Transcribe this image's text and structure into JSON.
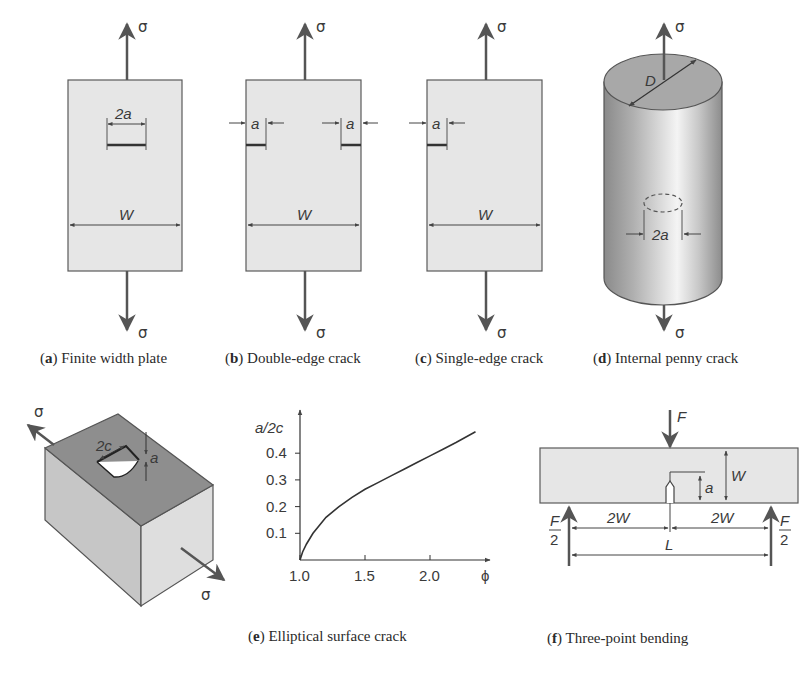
{
  "figure": {
    "colors": {
      "plate_fill": "#e6e6e6",
      "plate_stroke": "#5a5a5a",
      "arrow": "#555555",
      "text": "#3a3a3a",
      "box_top": "#8c8c8c",
      "box_left": "#c4c4c4",
      "box_right": "#dcdcdc",
      "curve": "#333333"
    },
    "panels": {
      "a": {
        "letter": "a",
        "caption": "Finite width plate",
        "stress_top": "σ",
        "stress_bottom": "σ",
        "crack_label": "2a",
        "width_label": "W"
      },
      "b": {
        "letter": "b",
        "caption": "Double-edge crack",
        "stress_top": "σ",
        "stress_bottom": "σ",
        "crack_label_left": "a",
        "crack_label_right": "a",
        "width_label": "W"
      },
      "c": {
        "letter": "c",
        "caption": "Single-edge crack",
        "stress_top": "σ",
        "stress_bottom": "σ",
        "crack_label": "a",
        "width_label": "W"
      },
      "d": {
        "letter": "d",
        "caption": "Internal penny crack",
        "stress_top": "σ",
        "stress_bottom": "σ",
        "diameter_label": "D",
        "crack_label": "2a"
      },
      "e": {
        "letter": "e",
        "caption": "Elliptical surface crack",
        "stress_top": "σ",
        "stress_bottom": "σ",
        "crack_length_label": "2c",
        "crack_depth_label": "a"
      },
      "f": {
        "letter": "f",
        "caption": "Three-point bending",
        "load_label": "F",
        "support_num": "F",
        "support_den": "2",
        "height_label": "W",
        "crack_label": "a",
        "half_span_left": "2W",
        "half_span_right": "2W",
        "span_label": "L"
      }
    }
  },
  "chart_data": {
    "type": "line",
    "title": "",
    "xlabel": "ϕ",
    "ylabel": "a/2c",
    "x_ticks": [
      "1.0",
      "1.5",
      "2.0"
    ],
    "y_ticks": [
      "0.1",
      "0.2",
      "0.3",
      "0.4"
    ],
    "xlim": [
      1.0,
      2.4
    ],
    "ylim": [
      0.0,
      0.5
    ],
    "grid": false,
    "legend": null,
    "series": [
      {
        "name": "a/2c vs ϕ",
        "x": [
          1.0,
          1.02,
          1.05,
          1.1,
          1.15,
          1.2,
          1.3,
          1.4,
          1.5,
          1.6,
          1.7,
          1.8,
          1.9,
          2.0,
          2.1,
          2.2,
          2.35
        ],
        "y": [
          0.0,
          0.03,
          0.06,
          0.1,
          0.13,
          0.16,
          0.2,
          0.235,
          0.265,
          0.29,
          0.315,
          0.34,
          0.365,
          0.39,
          0.415,
          0.44,
          0.48
        ]
      }
    ]
  }
}
